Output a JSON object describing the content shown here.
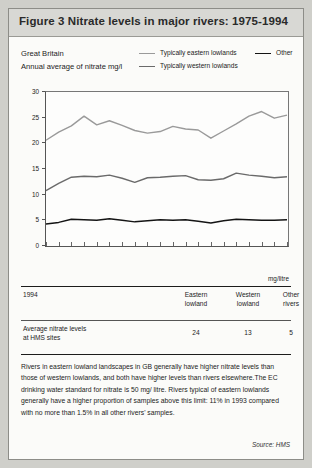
{
  "figure": {
    "title": "Figure 3   Nitrate levels in major rivers: 1975-1994",
    "region": "Great Britain",
    "subtitle": "Annual average of nitrate mg/l",
    "source": "Source:  HMS"
  },
  "colors": {
    "eastern": "#9a9a9a",
    "western": "#6a6a6a",
    "other": "#141414",
    "axis": "#555555",
    "card_bg": "#fbfbf9",
    "title_bg": "#d8d8d4"
  },
  "chart_data": {
    "type": "line",
    "title": "Nitrate levels in major rivers: 1975-1994",
    "xlabel": "",
    "ylabel": "Annual average of nitrate mg/l",
    "ylim": [
      0,
      30
    ],
    "yticks": [
      0,
      5,
      10,
      15,
      20,
      25,
      30
    ],
    "ytick_labels": [
      "0",
      "5",
      "10",
      "15",
      "20",
      "25",
      "30"
    ],
    "grid": false,
    "legend_position": "top",
    "x": [
      1975,
      1976,
      1977,
      1978,
      1979,
      1980,
      1981,
      1982,
      1983,
      1984,
      1985,
      1986,
      1987,
      1988,
      1989,
      1990,
      1991,
      1992,
      1993,
      1994
    ],
    "series": [
      {
        "name": "Typically eastern lowlands",
        "color": "#9a9a9a",
        "values": [
          20.6,
          22.2,
          23.4,
          25.3,
          23.6,
          24.4,
          23.5,
          22.5,
          22.0,
          22.3,
          23.3,
          22.8,
          22.6,
          21.0,
          22.4,
          23.8,
          25.3,
          26.2,
          24.9,
          25.5
        ]
      },
      {
        "name": "Typically western lowlands",
        "color": "#6a6a6a",
        "values": [
          10.8,
          12.2,
          13.4,
          13.6,
          13.5,
          13.8,
          13.2,
          12.4,
          13.3,
          13.4,
          13.6,
          13.7,
          12.9,
          12.8,
          13.1,
          14.2,
          13.8,
          13.6,
          13.3,
          13.5
        ]
      },
      {
        "name": "Other",
        "color": "#141414",
        "values": [
          4.3,
          4.6,
          5.2,
          5.1,
          5.0,
          5.3,
          5.0,
          4.7,
          4.9,
          5.1,
          5.0,
          5.1,
          4.8,
          4.5,
          4.9,
          5.2,
          5.1,
          5.0,
          5.0,
          5.1
        ]
      }
    ]
  },
  "legend": [
    {
      "label": "Typically eastern lowlands",
      "color": "#9a9a9a"
    },
    {
      "label": "Typically western lowlands",
      "color": "#6a6a6a"
    },
    {
      "label": "Other",
      "color": "#141414"
    }
  ],
  "table": {
    "unit": "mg/litre",
    "headers": [
      "1994",
      "Eastern lowland",
      "Western lowland",
      "Other rivers"
    ],
    "header_lines": [
      [
        "1994",
        ""
      ],
      [
        "Eastern",
        "lowland"
      ],
      [
        "Western",
        "lowland"
      ],
      [
        "Other",
        "rivers"
      ]
    ],
    "rows": [
      {
        "label_lines": [
          "Average nitrate levels",
          "at HMS sites"
        ],
        "values": [
          "24",
          "13",
          "5"
        ]
      }
    ]
  },
  "note": "Rivers in eastern lowland landscapes in GB generally have higher nitrate levels than those of western lowlands, and both have higher levels than rivers elsewhere.The EC drinking water standard for nitrate is 50 mg/ litre. Rivers typical of eastern lowlands generally have a higher proportion of samples above this limit: 11% in 1993 compared with no more than 1.5% in all other rivers' samples."
}
